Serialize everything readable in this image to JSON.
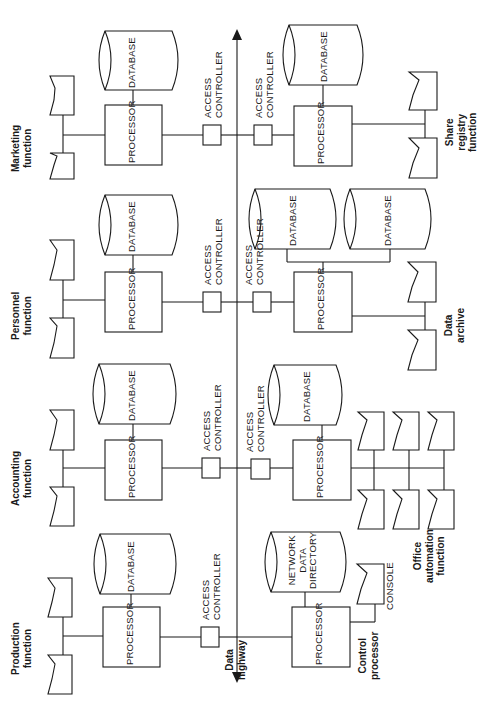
{
  "diagram": {
    "data_highway": {
      "line1": "Data",
      "line2": "highway"
    },
    "top_row": [
      {
        "function_line1": "Marketing",
        "function_line2": "function",
        "processor": "PROCESSOR",
        "database": "DATABASE",
        "access_line1": "ACCESS",
        "access_line2": "CONTROLLER"
      },
      {
        "function_line1": "Personnel",
        "function_line2": "function",
        "processor": "PROCESSOR",
        "database": "DATABASE",
        "access_line1": "ACCESS",
        "access_line2": "CONTROLLER"
      },
      {
        "function_line1": "Accounting",
        "function_line2": "function",
        "processor": "PROCESSOR",
        "database": "DATABASE",
        "access_line1": "ACCESS",
        "access_line2": "CONTROLLER"
      },
      {
        "function_line1": "Production",
        "function_line2": "function",
        "processor": "PROCESSOR",
        "database": "DATABASE",
        "access_line1": "ACCESS",
        "access_line2": "CONTROLLER"
      }
    ],
    "bottom_row": [
      {
        "function_line1": "Share",
        "function_line2": "registry",
        "function_line3": "function",
        "processor": "PROCESSOR",
        "database": "DATABASE",
        "access_line1": "ACCESS",
        "access_line2": "CONTROLLER"
      },
      {
        "function_line1": "Data",
        "function_line2": "archive",
        "processor": "PROCESSOR",
        "database_a": "DATABASE",
        "database_b": "DATABASE",
        "access_line1": "ACCESS",
        "access_line2": "CONTROLLER"
      },
      {
        "function_line1": "Office",
        "function_line2": "automation",
        "function_line3": "function",
        "processor": "PROCESSOR",
        "database": "DATABASE",
        "access_line1": "ACCESS",
        "access_line2": "CONTROLLER"
      },
      {
        "function_line1": "Control",
        "function_line2": "processor",
        "processor": "PROCESSOR",
        "database_line1": "NETWORK",
        "database_line2": "DATA",
        "database_line3": "DIRECTORY",
        "console": "CONSOLE"
      }
    ]
  }
}
